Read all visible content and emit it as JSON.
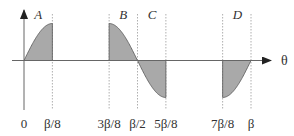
{
  "diagram": {
    "x_axis_label": "θ",
    "colors": {
      "fill": "#a9a9a9",
      "stroke": "#555555",
      "axis": "#666666",
      "guide": "#9a9a9a"
    },
    "tick_labels": [
      "0",
      "β/8",
      "3β/8",
      "β/2",
      "5β/8",
      "7β/8",
      "β"
    ],
    "tick_values": [
      0,
      0.125,
      0.375,
      0.5,
      0.625,
      0.875,
      1.0
    ],
    "regions": [
      {
        "label": "A",
        "from": 0,
        "to": 0.125,
        "sign": "positive",
        "shape": "rising to peak"
      },
      {
        "label": "B",
        "from": 0.375,
        "to": 0.5,
        "sign": "positive",
        "shape": "falling from peak to zero"
      },
      {
        "label": "C",
        "from": 0.5,
        "to": 0.625,
        "sign": "negative",
        "shape": "falling from zero to trough"
      },
      {
        "label": "D",
        "from": 0.875,
        "to": 1.0,
        "sign": "negative",
        "shape": "rising from trough to zero"
      }
    ]
  }
}
